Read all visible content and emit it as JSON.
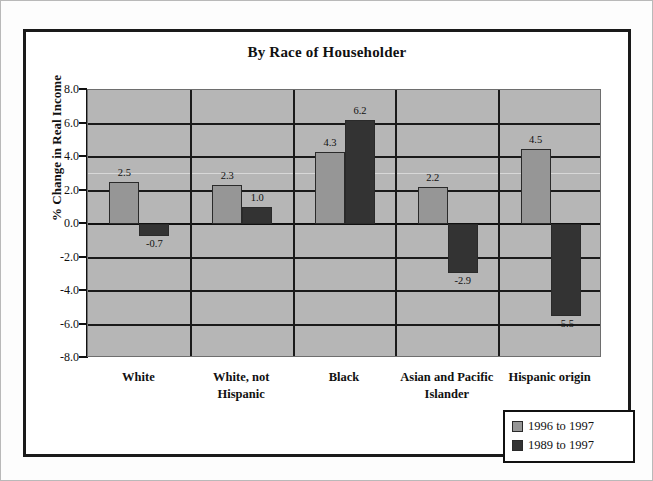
{
  "chart_data": {
    "type": "bar",
    "title": "By Race of Householder",
    "xlabel": "",
    "ylabel": "% Change in Real Income",
    "ylim": [
      -8.0,
      8.0
    ],
    "ytick_step": 2.0,
    "ytick_labels": [
      "8.0",
      "6.0",
      "4.0",
      "2.0",
      "0.0",
      "-2.0",
      "-4.0",
      "-6.0",
      "-8.0"
    ],
    "ytick_values": [
      8.0,
      6.0,
      4.0,
      2.0,
      0.0,
      -2.0,
      -4.0,
      -6.0,
      -8.0
    ],
    "grid": true,
    "legend_position": "bottom-right",
    "categories": [
      "White",
      "White, not Hispanic",
      "Black",
      "Asian and Pacific Islander",
      "Hispanic origin"
    ],
    "category_lines": [
      [
        "White"
      ],
      [
        "White, not",
        "Hispanic"
      ],
      [
        "Black"
      ],
      [
        "Asian and Pacific",
        "Islander"
      ],
      [
        "Hispanic origin"
      ]
    ],
    "series": [
      {
        "name": "1996 to 1997",
        "color": "#969696",
        "values": [
          2.5,
          2.3,
          4.3,
          2.2,
          4.5
        ],
        "labels": [
          "2.5",
          "2.3",
          "4.3",
          "2.2",
          "4.5"
        ]
      },
      {
        "name": "1989 to 1997",
        "color": "#333333",
        "values": [
          -0.7,
          1.0,
          6.2,
          -2.9,
          -5.5
        ],
        "labels": [
          "-0.7",
          "1.0",
          "6.2",
          "-2.9",
          "-5.5"
        ]
      }
    ]
  },
  "colors": {
    "plot_background": "#b6b6b6",
    "frame": "#1a1a1a",
    "series_light": "#969696",
    "series_dark": "#333333"
  }
}
